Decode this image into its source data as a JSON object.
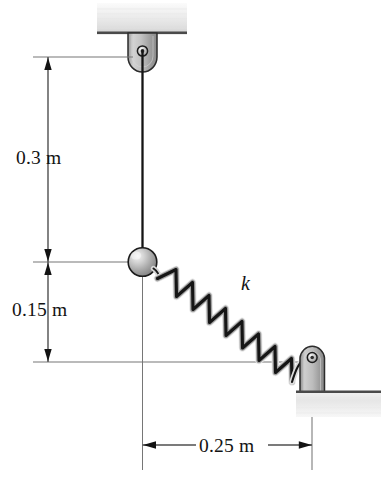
{
  "figure": {
    "kind": "mechanics-schematic",
    "background_color": "#ffffff"
  },
  "dimensions": {
    "vertical_upper": {
      "label": "0.3 m",
      "value": 0.3,
      "unit": "m",
      "from": "pulley-pin",
      "to": "ball-center"
    },
    "vertical_lower": {
      "label": "0.15 m",
      "value": 0.15,
      "unit": "m",
      "from": "ball-center",
      "to": "ground-level"
    },
    "horizontal": {
      "label": "0.25 m",
      "value": 0.25,
      "unit": "m",
      "from": "ball-vertical-axis",
      "to": "anchor-pin-axis"
    }
  },
  "annotations": {
    "spring_stiffness": {
      "label": "k",
      "meaning": "spring-stiffness"
    }
  },
  "elements": {
    "ceiling_block": "ceiling-support",
    "pulley_bracket": "pulley-bracket",
    "pulley_pin": "pulley-pin",
    "cord": "cord",
    "ball": "ball",
    "spring": "spring",
    "anchor_post": "anchor-post",
    "anchor_pin": "anchor-pin",
    "ground_block": "ground-support"
  },
  "colors": {
    "line": "#111111",
    "dimension_line": "#6d6d6d",
    "metal_light": "#f0f0f0",
    "metal_mid": "#b9b9b9",
    "metal_dark": "#8d8d8d",
    "hatch": "#d8d8d8",
    "text": "#131313"
  }
}
